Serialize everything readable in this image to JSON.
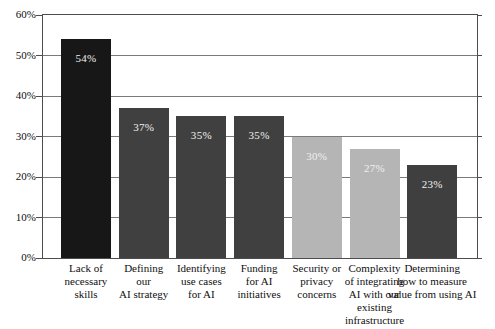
{
  "chart_data": {
    "type": "bar",
    "title": "",
    "xlabel": "",
    "ylabel": "",
    "categories": [
      "Lack of\nnecessary\nskills",
      "Defining\nour\nAI strategy",
      "Identifying\nuse cases\nfor AI",
      "Funding\nfor AI\ninitiatives",
      "Security or\nprivacy\nconcerns",
      "Complexity\nof integrating\nAI with our\nexisting\ninfrastructure",
      "Determining\nhow to measure\nvalue from using AI"
    ],
    "values": [
      54,
      37,
      35,
      35,
      30,
      27,
      23
    ],
    "value_labels": [
      "54%",
      "37%",
      "35%",
      "35%",
      "30%",
      "27%",
      "23%"
    ],
    "ylim": [
      0,
      60
    ],
    "ytick_values": [
      0,
      10,
      20,
      30,
      40,
      50,
      60
    ],
    "ytick_labels": [
      "0%",
      "10%",
      "20%",
      "30%",
      "40%",
      "50%",
      "60%"
    ],
    "grid": true,
    "legend": "none",
    "colors": {
      "bar_fills": [
        "#171717",
        "#404040",
        "#404040",
        "#404040",
        "#b5b5b5",
        "#b5b5b5",
        "#3f3f3f"
      ],
      "value_label_text": "#f0f0f0",
      "gridline": "#7a7a7a",
      "frame": "#4d4d4d",
      "axis_text": "#0f0f0f",
      "background": "#ffffff"
    }
  }
}
